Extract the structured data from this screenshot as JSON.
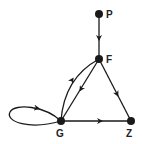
{
  "diagram": {
    "type": "directed-graph",
    "nodes": [
      {
        "id": "P",
        "label": "P"
      },
      {
        "id": "F",
        "label": "F"
      },
      {
        "id": "G",
        "label": "G"
      },
      {
        "id": "Z",
        "label": "Z"
      }
    ],
    "edges": [
      {
        "from": "P",
        "to": "F",
        "style": "straight"
      },
      {
        "from": "F",
        "to": "G",
        "style": "straight"
      },
      {
        "from": "G",
        "to": "F",
        "style": "curved"
      },
      {
        "from": "F",
        "to": "Z",
        "style": "straight"
      },
      {
        "from": "G",
        "to": "Z",
        "style": "straight"
      },
      {
        "from": "G",
        "to": "G",
        "style": "self-loop"
      }
    ]
  },
  "colors": {
    "ink": "#1a1a1a",
    "background": "#ffffff"
  }
}
